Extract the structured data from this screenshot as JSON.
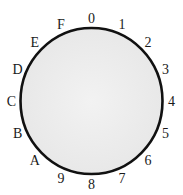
{
  "diagram": {
    "type": "hex-digit-ring",
    "labels": [
      "0",
      "1",
      "2",
      "3",
      "4",
      "5",
      "6",
      "7",
      "8",
      "9",
      "A",
      "B",
      "C",
      "D",
      "E",
      "F"
    ],
    "colors": {
      "ring_stroke": "#111111",
      "ring_fill": "#ececec",
      "label": "#1a1a1a"
    }
  }
}
